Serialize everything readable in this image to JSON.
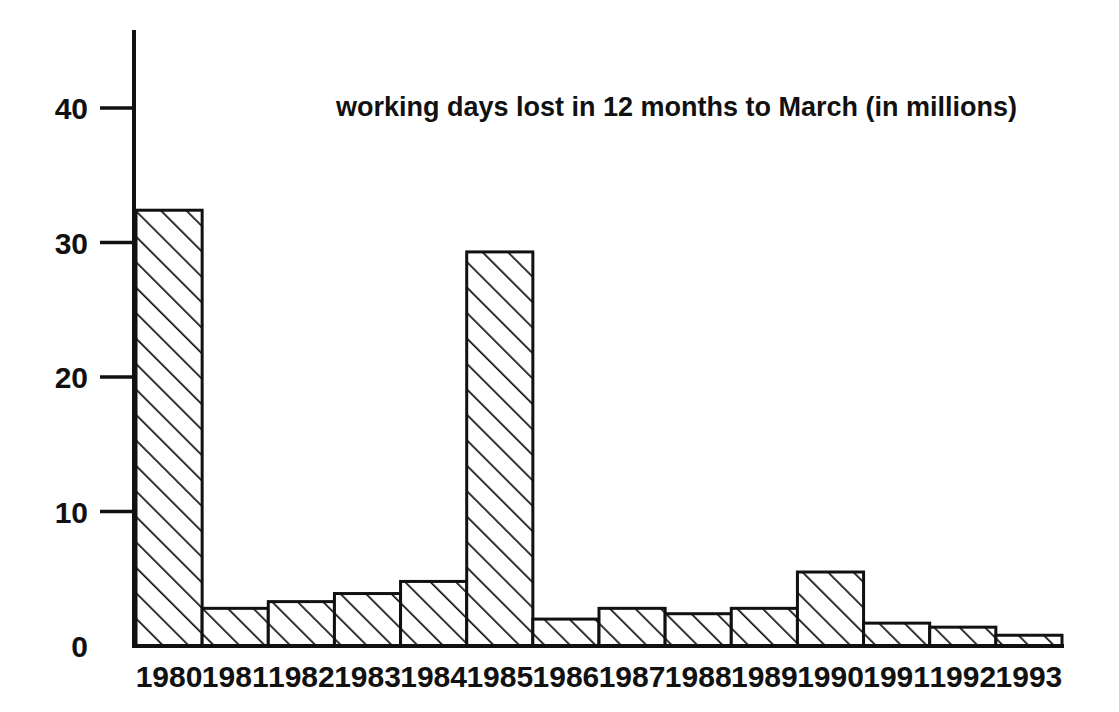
{
  "chart_data": {
    "type": "bar",
    "title": "working days lost in 12 months to March (in millions)",
    "xlabel": "",
    "ylabel": "",
    "categories": [
      "1980",
      "1981",
      "1982",
      "1983",
      "1984",
      "1985",
      "1986",
      "1987",
      "1988",
      "1989",
      "1990",
      "1991",
      "1992",
      "1993"
    ],
    "values": [
      32.4,
      2.8,
      3.3,
      3.9,
      4.8,
      29.3,
      2.0,
      2.8,
      2.4,
      2.8,
      5.5,
      1.7,
      1.4,
      0.8
    ],
    "ylim": [
      0,
      43
    ],
    "yticks": [
      0,
      10,
      20,
      30,
      40
    ],
    "ytick_labels": [
      "0",
      "10",
      "20",
      "30",
      "40"
    ],
    "grid": false,
    "legend": null,
    "bar_style": {
      "fill": "diagonal-hatch",
      "edge_color": "#111111",
      "background": "#ffffff",
      "gap": 0
    }
  },
  "axes": {
    "y_axis_name": "y-axis",
    "x_axis_name": "x-axis"
  }
}
